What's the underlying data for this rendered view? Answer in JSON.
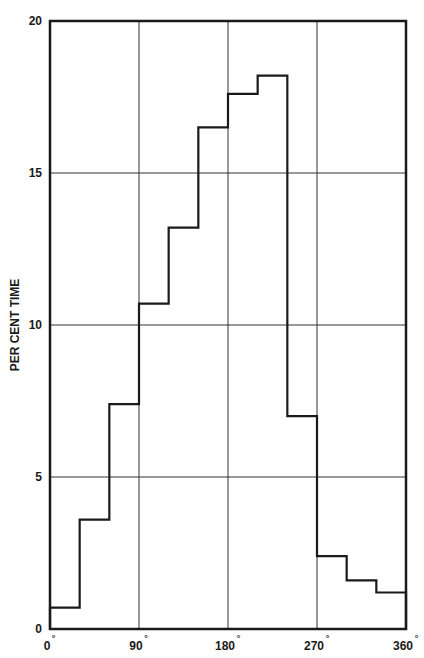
{
  "chart_data": {
    "type": "bar",
    "subtype": "step-histogram",
    "title": "",
    "xlabel": "",
    "ylabel": "PER CENT TIME",
    "x_bin_edges": [
      0,
      30,
      60,
      90,
      120,
      150,
      180,
      210,
      240,
      270,
      300,
      330,
      360
    ],
    "categories": [
      "0-30",
      "30-60",
      "60-90",
      "90-120",
      "120-150",
      "150-180",
      "180-210",
      "210-240",
      "240-270",
      "270-300",
      "300-330",
      "330-360"
    ],
    "values": [
      0.7,
      3.6,
      7.4,
      10.7,
      13.2,
      16.5,
      17.6,
      18.2,
      7.0,
      2.4,
      1.6,
      1.2
    ],
    "xlim": [
      0,
      360
    ],
    "ylim": [
      0,
      20
    ],
    "x_ticks": [
      0,
      90,
      180,
      270,
      360
    ],
    "x_tick_labels": [
      "0",
      "90",
      "180",
      "270",
      "360"
    ],
    "x_tick_suffix": "°",
    "y_ticks": [
      0,
      5,
      10,
      15,
      20
    ],
    "y_tick_labels": [
      "0",
      "5",
      "10",
      "15",
      "20"
    ],
    "grid": true,
    "legend": null,
    "colors": {
      "line": "#1a1a1a",
      "grid": "#333333",
      "background": "#ffffff"
    }
  }
}
